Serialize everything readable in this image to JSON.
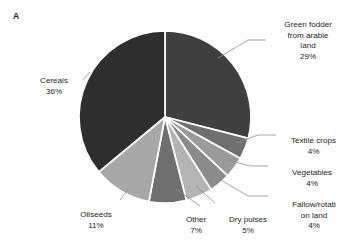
{
  "figure": {
    "panel_label": "A",
    "background_color": "#ffffff",
    "text_color": "#231f20"
  },
  "chart_data": {
    "type": "pie",
    "title": "",
    "subtitle": "",
    "xlabel": "",
    "ylabel": "",
    "legend_position": "none",
    "grid": false,
    "labels_show_percent": true,
    "start_angle_deg": 0,
    "direction": "clockwise",
    "categories": [
      "Green fodder from arable land",
      "Textile crops",
      "Vegetables",
      "Fallow/rotation land",
      "Dry pulses",
      "Other",
      "Oilseeds",
      "Cereals"
    ],
    "values": [
      29,
      4,
      4,
      4,
      5,
      7,
      11,
      36
    ],
    "units": "%",
    "slices": [
      {
        "label": "Green fodder from arable land",
        "display_lines": "Green fodder\nfrom arable\nland",
        "value": 29,
        "percent_text": "29%",
        "color": "#3f3f3f"
      },
      {
        "label": "Textile crops",
        "display_lines": "Textile crops",
        "value": 4,
        "percent_text": "4%",
        "color": "#707070"
      },
      {
        "label": "Vegetables",
        "display_lines": "Vegetables",
        "value": 4,
        "percent_text": "4%",
        "color": "#9b9b9b"
      },
      {
        "label": "Fallow/rotation land",
        "display_lines": "Fallow/rotati\non land",
        "value": 4,
        "percent_text": "4%",
        "color": "#8b8b8b"
      },
      {
        "label": "Dry pulses",
        "display_lines": "Dry pulses",
        "value": 5,
        "percent_text": "5%",
        "color": "#b4b4b4"
      },
      {
        "label": "Other",
        "display_lines": "Other",
        "value": 7,
        "percent_text": "7%",
        "color": "#6f6f6f"
      },
      {
        "label": "Oilseeds",
        "display_lines": "Oilseeds",
        "value": 11,
        "percent_text": "11%",
        "color": "#a8a8a8"
      },
      {
        "label": "Cereals",
        "display_lines": "Cereals",
        "value": 36,
        "percent_text": "36%",
        "color": "#2e2e2e"
      }
    ]
  },
  "labels": {
    "green_fodder": {
      "name": "Green fodder\nfrom arable\nland",
      "percent": "29%"
    },
    "cereals": {
      "name": "Cereals",
      "percent": "36%"
    },
    "textile": {
      "name": "Textile crops",
      "percent": "4%"
    },
    "vegetables": {
      "name": "Vegetables",
      "percent": "4%"
    },
    "fallow": {
      "name": "Fallow/rotati\non land",
      "percent": "4%"
    },
    "dry_pulses": {
      "name": "Dry pulses",
      "percent": "5%"
    },
    "other": {
      "name": "Other",
      "percent": "7%"
    },
    "oilseeds": {
      "name": "Oilseeds",
      "percent": "11%"
    }
  }
}
